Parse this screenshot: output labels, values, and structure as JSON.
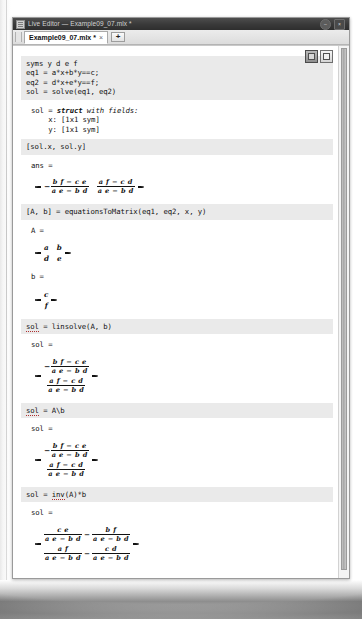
{
  "window": {
    "title": "Live Editor — Example09_07.mlx *",
    "app_icon": "matlab-icon",
    "minimize_label": "–",
    "close_label": "×"
  },
  "tabbar": {
    "tab_label": "Example09_07.mlx *",
    "tab_close": "×",
    "add_tab_label": "+"
  },
  "corner_tools": {
    "tool1_name": "output-inline-icon",
    "tool2_name": "output-right-icon"
  },
  "blocks": [
    {
      "kind": "code",
      "name": "code-cell-1",
      "text": "syms y d e f\neq1 = a*x+b*y==c;\neq2 = d*x+e*y==f;\nsol = solve(eq1, eq2)"
    },
    {
      "kind": "output-text",
      "name": "output-struct",
      "line1_var": "sol = ",
      "line1_kw": "struct",
      "line1_rest": " with fields:",
      "line2": "    x: [1x1 sym]",
      "line3": "    y: [1x1 sym]"
    },
    {
      "kind": "code",
      "name": "code-cell-2",
      "text": "[sol.x, sol.y]"
    },
    {
      "kind": "output-label",
      "name": "output-ans-label",
      "text": "ans ="
    },
    {
      "kind": "matrix",
      "name": "matrix-ans",
      "rows": [
        [
          {
            "neg": "−",
            "num": "b f − c e",
            "den": "a e − b d"
          },
          {
            "neg": "",
            "num": "a f − c d",
            "den": "a e − b d"
          }
        ]
      ]
    },
    {
      "kind": "code",
      "name": "code-cell-3",
      "text": "[A, b] = equationsToMatrix(eq1, eq2, x, y)"
    },
    {
      "kind": "output-label",
      "name": "output-A-label",
      "text": "A ="
    },
    {
      "kind": "matrix-plain",
      "name": "matrix-A",
      "rows": [
        [
          "a",
          "b"
        ],
        [
          "d",
          "e"
        ]
      ]
    },
    {
      "kind": "output-label",
      "name": "output-b-label",
      "text": "b ="
    },
    {
      "kind": "matrix-plain",
      "name": "matrix-b",
      "rows": [
        [
          "c"
        ],
        [
          "f"
        ]
      ]
    },
    {
      "kind": "code",
      "name": "code-cell-4",
      "text": "sol = linsolve(A, b)",
      "warn_token": "sol"
    },
    {
      "kind": "output-label",
      "name": "output-sol-label-1",
      "text": "sol ="
    },
    {
      "kind": "matrix",
      "name": "matrix-sol-linsolve",
      "rows": [
        [
          {
            "neg": "−",
            "num": "b f − c e",
            "den": "a e − b d"
          }
        ],
        [
          {
            "neg": "",
            "num": "a f − c d",
            "den": "a e − b d"
          }
        ]
      ]
    },
    {
      "kind": "code",
      "name": "code-cell-5",
      "text": "sol = A\\b",
      "warn_token": "sol"
    },
    {
      "kind": "output-label",
      "name": "output-sol-label-2",
      "text": "sol ="
    },
    {
      "kind": "matrix",
      "name": "matrix-sol-backslash",
      "rows": [
        [
          {
            "neg": "−",
            "num": "b f − c e",
            "den": "a e − b d"
          }
        ],
        [
          {
            "neg": "",
            "num": "a f − c d",
            "den": "a e − b d"
          }
        ]
      ]
    },
    {
      "kind": "code",
      "name": "code-cell-6",
      "text": "sol = inv(A)*b",
      "warn_token": "inv"
    },
    {
      "kind": "output-label",
      "name": "output-sol-label-3",
      "text": "sol ="
    },
    {
      "kind": "matrix-twoterm",
      "name": "matrix-sol-inv",
      "rows": [
        [
          {
            "num": "c e",
            "den": "a e − b d"
          },
          {
            "op": "−"
          },
          {
            "num": "b f",
            "den": "a e − b d"
          }
        ],
        [
          {
            "num": "a f",
            "den": "a e − b d"
          },
          {
            "op": "−"
          },
          {
            "num": "c d",
            "den": "a e − b d"
          }
        ]
      ]
    }
  ],
  "text": {
    "code1": "syms y d e f\neq1 = a*x+b*y==c;\neq2 = d*x+e*y==f;\nsol = solve(eq1, eq2)",
    "struct_l1a": "sol = ",
    "struct_kw": "struct",
    "struct_l1b": " with fields:",
    "struct_l2": "    x: [1x1 sym]",
    "struct_l3": "    y: [1x1 sym]",
    "code2": "[sol.x, sol.y]",
    "ans_label": "ans =",
    "code3": "[A, b] = equationsToMatrix(eq1, eq2, x, y)",
    "A_label": "A =",
    "b_label": "b =",
    "code4a": "sol",
    "code4b": " = linsolve(A, b)",
    "sol_label": "sol =",
    "code5a": "sol",
    "code5b": " = A\\b",
    "code6a": "sol = ",
    "code6b": "inv",
    "code6c": "(A)*b"
  },
  "scrollbar": {
    "name": "vertical-scrollbar"
  }
}
